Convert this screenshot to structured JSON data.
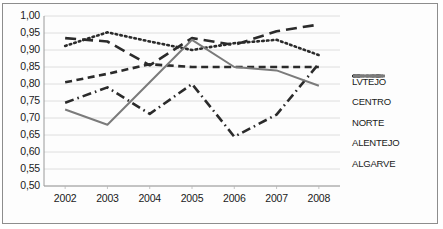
{
  "chart_data": {
    "type": "line",
    "title": "",
    "xlabel": "",
    "ylabel": "",
    "x": [
      2002,
      2003,
      2004,
      2005,
      2006,
      2007,
      2008
    ],
    "xtick_labels": [
      "2002",
      "2003",
      "2004",
      "2005",
      "2006",
      "2007",
      "2008"
    ],
    "ylim": [
      0.5,
      1.0
    ],
    "ytick_values": [
      0.5,
      0.55,
      0.6,
      0.65,
      0.7,
      0.75,
      0.8,
      0.85,
      0.9,
      0.95,
      1.0
    ],
    "ytick_labels": [
      "0,50",
      "0,55",
      "0,60",
      "0,65",
      "0,70",
      "0,75",
      "0,80",
      "0,85",
      "0,90",
      "0,95",
      "1,00"
    ],
    "grid": "horizontal",
    "legend_position": "right",
    "series": [
      {
        "name": "LVTEJO",
        "style": "dashed",
        "color": "#2b2b2b",
        "values": [
          0.935,
          0.925,
          0.855,
          0.935,
          0.915,
          0.955,
          0.975
        ]
      },
      {
        "name": "CENTRO",
        "style": "dotted",
        "color": "#2b2b2b",
        "values": [
          0.912,
          0.952,
          0.925,
          0.9,
          0.92,
          0.93,
          0.885
        ]
      },
      {
        "name": "NORTE",
        "style": "dash-short",
        "color": "#2b2b2b",
        "values": [
          0.805,
          0.83,
          0.858,
          0.85,
          0.85,
          0.85,
          0.85
        ]
      },
      {
        "name": "ALENTEJO",
        "style": "dash-dot",
        "color": "#2b2b2b",
        "values": [
          0.745,
          0.79,
          0.712,
          0.8,
          0.645,
          0.71,
          0.86
        ]
      },
      {
        "name": "ALGARVE",
        "style": "solid",
        "color": "#7b7b7b",
        "values": [
          0.725,
          0.68,
          0.805,
          0.93,
          0.85,
          0.84,
          0.795
        ]
      }
    ]
  }
}
